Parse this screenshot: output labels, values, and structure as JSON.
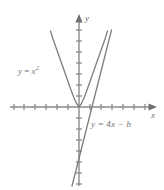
{
  "figure": {
    "kind": "cartesian-graph",
    "width": 164,
    "height": 190,
    "background": "#ffffff",
    "stroke_color": "#8a8a8a",
    "curve_color": "#7d7d7d",
    "label_color": "#6e6e6e"
  },
  "axes": {
    "x_label": "x",
    "y_label": "y",
    "origin": {
      "x": 79,
      "y": 107
    },
    "x_range_px": {
      "min": 10,
      "max": 157
    },
    "y_range_px": {
      "min": 14,
      "max": 186
    },
    "tick_spacing_px": 11,
    "x_ticks_left": 6,
    "x_ticks_right": 6,
    "y_ticks_up": 7,
    "y_ticks_down": 6,
    "tick_half_len": 3,
    "grid": false,
    "arrowheads": [
      "x-positive",
      "y-positive"
    ]
  },
  "labels": {
    "parabola": {
      "text": "y = x²",
      "lhs": "y",
      "eq": "=",
      "base": "x",
      "exponent": "2",
      "x": 18,
      "y": 67
    },
    "line": {
      "text": "y = 4x − b",
      "lhs": "y",
      "eq": "=",
      "rhs": "4x − b",
      "x": 91,
      "y": 120
    }
  },
  "chart_data": {
    "type": "line",
    "title": "",
    "xlabel": "x",
    "ylabel": "y",
    "grid": false,
    "legend": "inline-annotations",
    "xlim": [
      -6.3,
      7.1
    ],
    "ylim": [
      -7.2,
      8.5
    ],
    "annotations": [
      {
        "text": "y = x²",
        "x_px": 18,
        "y_px": 67
      },
      {
        "text": "y = 4x − b",
        "x_px": 91,
        "y_px": 120
      }
    ],
    "series": [
      {
        "name": "y = x²",
        "equation": "y = x^2",
        "type": "parabola",
        "color": "#7d7d7d",
        "vertex": [
          0,
          0
        ],
        "opens": "up",
        "points_px": [
          [
            50.5,
            31.0
          ],
          [
            53.0,
            39.0
          ],
          [
            56.0,
            47.5
          ],
          [
            59.0,
            56.0
          ],
          [
            62.0,
            64.5
          ],
          [
            65.0,
            73.0
          ],
          [
            68.0,
            81.5
          ],
          [
            71.0,
            90.0
          ],
          [
            74.0,
            98.0
          ],
          [
            76.5,
            103.5
          ],
          [
            79.0,
            106.8
          ],
          [
            81.5,
            103.5
          ],
          [
            84.0,
            98.0
          ],
          [
            87.0,
            90.0
          ],
          [
            90.0,
            81.5
          ],
          [
            93.0,
            73.0
          ],
          [
            96.0,
            64.5
          ],
          [
            99.0,
            56.0
          ],
          [
            102.0,
            47.5
          ],
          [
            105.0,
            39.0
          ],
          [
            107.5,
            31.0
          ]
        ]
      },
      {
        "name": "y = 4x − b",
        "equation": "y = 4x - b",
        "type": "line",
        "color": "#7d7d7d",
        "slope_px": -4.0,
        "points_px": [
          [
            72.0,
            186.0
          ],
          [
            111.5,
            30.0
          ]
        ]
      }
    ]
  }
}
